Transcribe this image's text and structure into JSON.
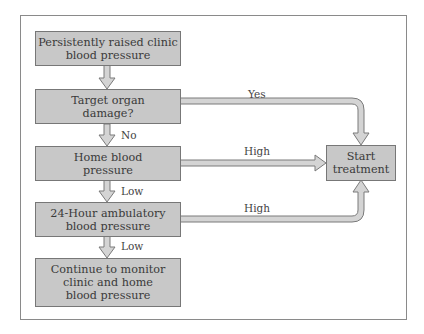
{
  "diagram": {
    "type": "flowchart",
    "nodes": [
      {
        "id": "clinic",
        "label": "Persistently raised clinic blood pressure",
        "lines": [
          "Persistently raised clinic",
          "blood pressure"
        ]
      },
      {
        "id": "organ",
        "label": "Target organ damage?",
        "lines": [
          "Target organ",
          "damage?"
        ]
      },
      {
        "id": "home",
        "label": "Home blood pressure",
        "lines": [
          "Home blood",
          "pressure"
        ]
      },
      {
        "id": "ambulatory",
        "label": "24-Hour ambulatory blood pressure",
        "lines": [
          "24-Hour ambulatory",
          "blood pressure"
        ]
      },
      {
        "id": "monitor",
        "label": "Continue to monitor clinic and home blood pressure",
        "lines": [
          "Continue to monitor",
          "clinic and home",
          "blood pressure"
        ]
      },
      {
        "id": "treat",
        "label": "Start treatment",
        "lines": [
          "Start",
          "treatment"
        ]
      }
    ],
    "edges": [
      {
        "from": "clinic",
        "to": "organ",
        "label": ""
      },
      {
        "from": "organ",
        "to": "home",
        "label": "No"
      },
      {
        "from": "home",
        "to": "ambulatory",
        "label": "Low"
      },
      {
        "from": "ambulatory",
        "to": "monitor",
        "label": "Low"
      },
      {
        "from": "organ",
        "to": "treat",
        "label": "Yes"
      },
      {
        "from": "home",
        "to": "treat",
        "label": "High"
      },
      {
        "from": "ambulatory",
        "to": "treat",
        "label": "High"
      }
    ],
    "colors": {
      "box_fill": "#c8c8c8",
      "box_border": "#777777",
      "arrow_fill": "#d4d4d4",
      "arrow_stroke": "#7a7a7a",
      "frame": "#8a8a8a"
    }
  }
}
